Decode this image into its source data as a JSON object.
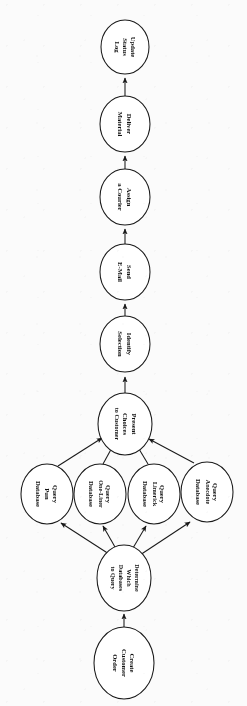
{
  "document": {
    "kind": "flowchart",
    "orientation": "rotated-90-clockwise",
    "background_color": "#fbfbfb",
    "stroke_color": "#1a1a1a",
    "node_fill_color": "#ffffff",
    "text_color": "#111111",
    "reading_direction": "bottom-to-top"
  },
  "nodes": {
    "create_customer_order": {
      "id": "create-customer-order",
      "lines": [
        "Create",
        "Customer",
        "Order"
      ],
      "full_label": "Create Customer Order",
      "cx": 124,
      "cy": 663,
      "rx": 30,
      "ry": 36
    },
    "determine_databases": {
      "id": "determine-which-databases-to-query",
      "lines": [
        "Determine",
        "Which",
        "Databases",
        "to Query"
      ],
      "full_label": "Determine Which Databases to Query",
      "cx": 124,
      "cy": 578,
      "rx": 27,
      "ry": 33
    },
    "query_pun": {
      "id": "query-pun-database",
      "lines": [
        "Query",
        "Pun",
        "Database"
      ],
      "full_label": "Query Pun Database",
      "cx": 47,
      "cy": 494,
      "rx": 26,
      "ry": 30
    },
    "query_one_liner": {
      "id": "query-one-liner-database",
      "lines": [
        "Query",
        "One-Liner",
        "Database"
      ],
      "full_label": "Query One-Liner Database",
      "cx": 100,
      "cy": 494,
      "rx": 26,
      "ry": 30
    },
    "query_limerick": {
      "id": "query-limerick-database",
      "lines": [
        "Query",
        "Limerick",
        "Database"
      ],
      "full_label": "Query Limerick Database",
      "cx": 154,
      "cy": 494,
      "rx": 26,
      "ry": 30
    },
    "query_anecdote": {
      "id": "query-anecdote-database",
      "lines": [
        "Query",
        "Anecdote",
        "Database"
      ],
      "full_label": "Query Anecdote Database",
      "cx": 207,
      "cy": 492,
      "rx": 26,
      "ry": 30
    },
    "present_choices": {
      "id": "present-choices-to-customer",
      "lines": [
        "Present",
        "Choices",
        "to Customer"
      ],
      "full_label": "Present Choices to Customer",
      "cx": 125,
      "cy": 424,
      "rx": 27,
      "ry": 31
    },
    "identify_selection": {
      "id": "identify-selection",
      "lines": [
        "Identify",
        "Selection"
      ],
      "full_label": "Identify Selection",
      "cx": 125,
      "cy": 344,
      "rx": 25,
      "ry": 28
    },
    "send_email": {
      "id": "send-e-mail",
      "lines": [
        "Send",
        "E-Mail"
      ],
      "full_label": "Send E-Mail",
      "cx": 125,
      "cy": 272,
      "rx": 25,
      "ry": 28
    },
    "assign_courier": {
      "id": "assign-a-courier",
      "lines": [
        "Assign",
        "a Courier"
      ],
      "full_label": "Assign a Courier",
      "cx": 125,
      "cy": 197,
      "rx": 25,
      "ry": 28
    },
    "deliver_material": {
      "id": "deliver-material",
      "lines": [
        "Deliver",
        "Material"
      ],
      "full_label": "Deliver Material",
      "cx": 125,
      "cy": 124,
      "rx": 25,
      "ry": 28
    },
    "update_status_log": {
      "id": "update-status-log",
      "lines": [
        "Update",
        "Status",
        "Log"
      ],
      "full_label": "Update Status Log",
      "cx": 125,
      "cy": 47,
      "rx": 24,
      "ry": 27
    }
  },
  "edges": [
    {
      "id": "edge-create-to-determine",
      "from": "Create Customer Order",
      "to": "Determine Which Databases to Query",
      "x1": 124,
      "y1": 627,
      "x2": 124,
      "y2": 613
    },
    {
      "id": "edge-determine-to-pun",
      "from": "Determine Which Databases to Query",
      "to": "Query Pun Database",
      "x1": 108,
      "y1": 553,
      "x2": 59,
      "y2": 522
    },
    {
      "id": "edge-determine-to-one-liner",
      "from": "Determine Which Databases to Query",
      "to": "Query One-Liner Database",
      "x1": 115,
      "y1": 547,
      "x2": 102,
      "y2": 524
    },
    {
      "id": "edge-determine-to-limerick",
      "from": "Determine Which Databases to Query",
      "to": "Query Limerick Database",
      "x1": 133,
      "y1": 548,
      "x2": 147,
      "y2": 524
    },
    {
      "id": "edge-determine-to-anecdote",
      "from": "Determine Which Databases to Query",
      "to": "Query Anecdote Database",
      "x1": 141,
      "y1": 554,
      "x2": 192,
      "y2": 521
    },
    {
      "id": "edge-pun-to-present",
      "from": "Query Pun Database",
      "to": "Present Choices to Customer",
      "x1": 59,
      "y1": 466,
      "x2": 104,
      "y2": 437
    },
    {
      "id": "edge-one-liner-to-present",
      "from": "Query One-Liner Database",
      "to": "Present Choices to Customer",
      "x1": 104,
      "y1": 464,
      "x2": 115,
      "y2": 441
    },
    {
      "id": "edge-limerick-to-present",
      "from": "Query Limerick Database",
      "to": "Present Choices to Customer",
      "x1": 147,
      "y1": 464,
      "x2": 135,
      "y2": 441
    },
    {
      "id": "edge-anecdote-to-present",
      "from": "Query Anecdote Database",
      "to": "Present Choices to Customer",
      "x1": 193,
      "y1": 464,
      "x2": 147,
      "y2": 438
    },
    {
      "id": "edge-present-to-identify",
      "from": "Present Choices to Customer",
      "to": "Identify Selection",
      "x1": 125,
      "y1": 393,
      "x2": 125,
      "y2": 375
    },
    {
      "id": "edge-identify-to-send-email",
      "from": "Identify Selection",
      "to": "Send E-Mail",
      "x1": 125,
      "y1": 316,
      "x2": 125,
      "y2": 303
    },
    {
      "id": "edge-send-email-to-assign",
      "from": "Send E-Mail",
      "to": "Assign a Courier",
      "x1": 125,
      "y1": 244,
      "x2": 125,
      "y2": 228
    },
    {
      "id": "edge-assign-to-deliver",
      "from": "Assign a Courier",
      "to": "Deliver Material",
      "x1": 125,
      "y1": 169,
      "x2": 125,
      "y2": 155
    },
    {
      "id": "edge-deliver-to-update",
      "from": "Deliver Material",
      "to": "Update Status Log",
      "x1": 125,
      "y1": 96,
      "x2": 125,
      "y2": 77
    }
  ]
}
